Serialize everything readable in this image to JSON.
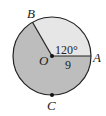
{
  "diagram": {
    "type": "circle-sector",
    "center_label": "O",
    "points": {
      "A": "A",
      "B": "B",
      "C": "C"
    },
    "angle_label": "120°",
    "radius_label": "9",
    "colors": {
      "minor_sector": "#e6e6e6",
      "major_sector": "#bdbdbd",
      "stroke": "#222222"
    }
  }
}
